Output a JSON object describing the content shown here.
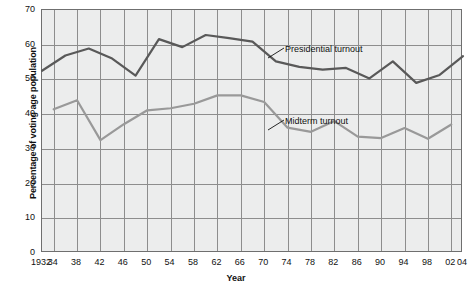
{
  "chart_data": {
    "type": "line",
    "title": "",
    "xlabel": "Year",
    "ylabel": "Percentage of voting age population",
    "ylim": [
      0,
      70
    ],
    "ytick_values": [
      0,
      10,
      20,
      30,
      40,
      50,
      60,
      70
    ],
    "ytick_labels": [
      "0",
      "10",
      "20",
      "30",
      "40",
      "50",
      "60",
      "70"
    ],
    "xlim": [
      1932,
      2004
    ],
    "xtick_values": [
      1932,
      1934,
      1938,
      1942,
      1946,
      1950,
      1954,
      1958,
      1962,
      1966,
      1970,
      1974,
      1978,
      1982,
      1986,
      1990,
      1994,
      1998,
      2002,
      2004
    ],
    "xtick_labels": [
      "1932",
      "34",
      "38",
      "42",
      "46",
      "50",
      "54",
      "58",
      "62",
      "66",
      "70",
      "74",
      "78",
      "82",
      "86",
      "90",
      "94",
      "98",
      "02",
      "04"
    ],
    "grid": true,
    "grid_x_values": [
      1934,
      1938,
      1942,
      1946,
      1950,
      1954,
      1958,
      1962,
      1966,
      1970,
      1974,
      1978,
      1982,
      1986,
      1990,
      1994,
      1998,
      2002
    ],
    "legend_position": "inline-annotations",
    "series": [
      {
        "name": "Presidential turnout",
        "color": "#595959",
        "x": [
          1932,
          1936,
          1940,
          1944,
          1948,
          1952,
          1956,
          1960,
          1964,
          1968,
          1972,
          1976,
          1980,
          1984,
          1988,
          1992,
          1996,
          2000,
          2004
        ],
        "values": [
          52.5,
          56.9,
          58.9,
          56.0,
          51.1,
          61.6,
          59.3,
          62.8,
          61.9,
          60.9,
          55.2,
          53.6,
          52.8,
          53.3,
          50.3,
          55.2,
          49.0,
          51.3,
          56.7
        ]
      },
      {
        "name": "Midterm turnout",
        "color": "#999999",
        "x": [
          1934,
          1938,
          1942,
          1946,
          1950,
          1954,
          1958,
          1962,
          1966,
          1970,
          1974,
          1978,
          1982,
          1986,
          1990,
          1994,
          1998,
          2002
        ],
        "values": [
          41.4,
          44.0,
          32.5,
          37.1,
          41.1,
          41.7,
          43.0,
          45.4,
          45.4,
          43.5,
          36.1,
          34.9,
          38.0,
          33.5,
          33.1,
          36.0,
          32.9,
          37.0
        ]
      }
    ],
    "annotations": [
      {
        "text": "Presidential turnout",
        "series": "Presidential turnout"
      },
      {
        "text": "Midterm turnout",
        "series": "Midterm turnout"
      }
    ]
  }
}
